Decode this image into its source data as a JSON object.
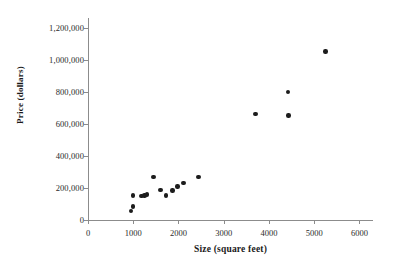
{
  "chart_data": {
    "type": "scatter",
    "title": "",
    "xlabel": "Size (square feet)",
    "ylabel": "Price (dollars)",
    "xlim": [
      0,
      6300
    ],
    "ylim": [
      0,
      1260000
    ],
    "grid": false,
    "legend": "none",
    "marker_color": "#1c1c1c",
    "xticks": [
      0,
      1000,
      2000,
      3000,
      4000,
      5000,
      6000
    ],
    "xtick_labels": [
      "0",
      "1000",
      "2000",
      "3000",
      "4000",
      "5000",
      "6000"
    ],
    "yticks": [
      0,
      200000,
      400000,
      600000,
      800000,
      1000000,
      1200000
    ],
    "ytick_labels": [
      "0",
      "200,000",
      "400,000",
      "600,000",
      "800,000",
      "1,000,000",
      "1,200,000"
    ],
    "points": [
      {
        "x": 950,
        "y": 58000
      },
      {
        "x": 1000,
        "y": 85000
      },
      {
        "x": 1000,
        "y": 152000
      },
      {
        "x": 1180,
        "y": 150000
      },
      {
        "x": 1250,
        "y": 152000
      },
      {
        "x": 1300,
        "y": 158000
      },
      {
        "x": 1450,
        "y": 270000
      },
      {
        "x": 1600,
        "y": 188000
      },
      {
        "x": 1730,
        "y": 152000
      },
      {
        "x": 1870,
        "y": 185000
      },
      {
        "x": 1980,
        "y": 210000
      },
      {
        "x": 2110,
        "y": 230000
      },
      {
        "x": 2440,
        "y": 270000
      },
      {
        "x": 3700,
        "y": 660000
      },
      {
        "x": 4420,
        "y": 800000
      },
      {
        "x": 4430,
        "y": 652000
      },
      {
        "x": 5250,
        "y": 1050000
      }
    ]
  }
}
